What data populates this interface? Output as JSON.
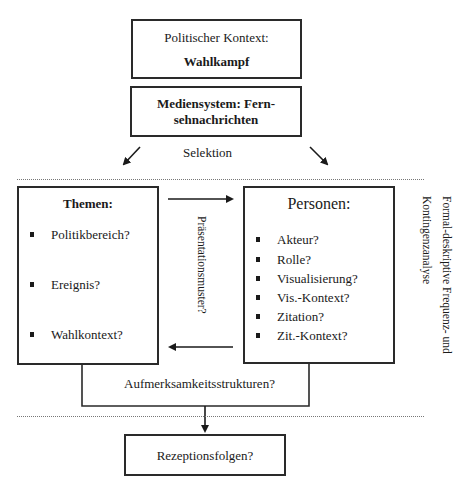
{
  "context_box": {
    "label": "Politischer Kontext:",
    "value": "Wahlkampf"
  },
  "media_box": {
    "line1": "Mediensystem: Fern-",
    "line2": "sehnachrichten"
  },
  "selection_label": "Selektion",
  "themes_box": {
    "title": "Themen:",
    "items": [
      "Politikbereich?",
      "Ereignis?",
      "Wahlkontext?"
    ]
  },
  "persons_box": {
    "title": "Personen:",
    "items": [
      "Akteur?",
      "Rolle?",
      "Visualisierung?",
      "Vis.-Kontext?",
      "Zitation?",
      "Zit.-Kontext?"
    ]
  },
  "presentation_label": "Präsentationsmuster?",
  "attention_label": "Aufmerksamkeitsstrukturen?",
  "analysis_label": {
    "line1": "Formal-deskriptive Frequenz- und",
    "line2": "Kontingenzanalyse"
  },
  "reception_box": {
    "label": "Rezeptionsfolgen?"
  },
  "colors": {
    "line": "#2a2a2a",
    "dotted": "#777777",
    "text": "#1a1a1a"
  }
}
